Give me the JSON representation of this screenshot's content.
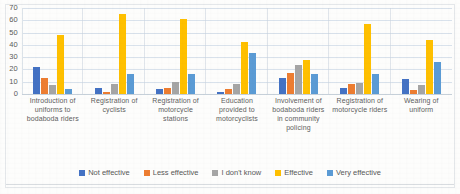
{
  "chart_data": {
    "type": "bar",
    "title": "",
    "xlabel": "",
    "ylabel": "",
    "ylim": [
      0,
      70
    ],
    "yticks": [
      0,
      10,
      20,
      30,
      40,
      50,
      60,
      70
    ],
    "grid": true,
    "legend_position": "bottom",
    "categories": [
      "Introduction of uniforms to bodaboda riders",
      "Registration of cyclists",
      "Registration of motorcycle stations",
      "Education provided to motorcyclists",
      "Involvement of bodaboda riders in community policing",
      "Registration of motorcycle riders",
      "Wearing of uniform"
    ],
    "series": [
      {
        "name": "Not effective",
        "color": "#4472C4",
        "values": [
          22,
          5,
          4,
          2,
          13,
          5,
          12
        ]
      },
      {
        "name": "Less effective",
        "color": "#ED7D31",
        "values": [
          13,
          2,
          5,
          4,
          17,
          8,
          3
        ]
      },
      {
        "name": "I don't know",
        "color": "#A5A5A5",
        "values": [
          7,
          8,
          10,
          8,
          24,
          9,
          7
        ]
      },
      {
        "name": "Effective",
        "color": "#FFC000",
        "values": [
          48,
          65,
          61,
          42,
          28,
          57,
          44
        ]
      },
      {
        "name": "Very effective",
        "color": "#5B9BD5",
        "values": [
          4,
          16,
          16,
          33,
          16,
          16,
          26
        ]
      }
    ]
  }
}
